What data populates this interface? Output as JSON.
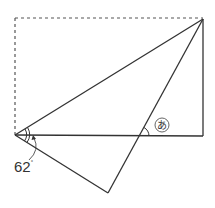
{
  "diagram": {
    "type": "geometry-folded-rectangle",
    "colors": {
      "line": "#333333",
      "dashed": "#555555",
      "background": "#ffffff"
    },
    "points": {
      "rect_top_left": [
        15,
        18
      ],
      "rect_top_right": [
        203,
        19
      ],
      "rect_bottom_left": [
        15,
        135
      ],
      "rect_bottom_right": [
        203,
        136
      ],
      "folded_corner": [
        108,
        193
      ],
      "intersection": [
        139,
        136
      ]
    },
    "labels": {
      "given_angle": "62",
      "given_angle_unit": "°",
      "unknown_angle": "あ"
    }
  }
}
